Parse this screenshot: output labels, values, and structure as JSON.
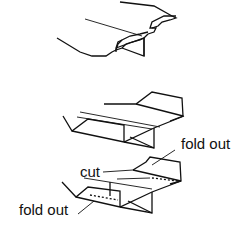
{
  "diagram": {
    "type": "folding-sequence",
    "steps": [
      {
        "step": 1,
        "description": "Flat strip with notched tabs at both edges and central triangular fold"
      },
      {
        "step": 2,
        "description": "Strip folded into trough shape with raised side panels"
      },
      {
        "step": 3,
        "description": "Folded piece showing cut line and fold-out flaps"
      }
    ],
    "labels": {
      "fold_out_top": "fold out",
      "cut": "cut",
      "fold_out_bottom": "fold out"
    },
    "colors": {
      "line": "#111111",
      "background": "#ffffff"
    }
  }
}
